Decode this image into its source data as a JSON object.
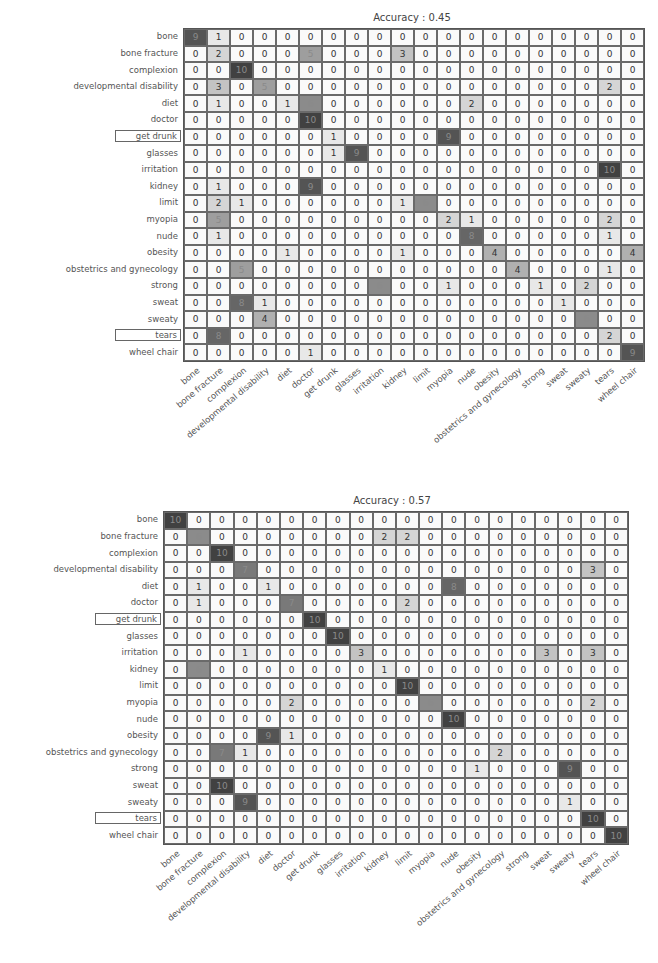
{
  "chart_data": [
    {
      "type": "heatmap",
      "title": "Accuracy : 0.45",
      "xlabel": "",
      "ylabel": "",
      "categories": [
        "bone",
        "bone fracture",
        "complexion",
        "developmental disability",
        "diet",
        "doctor",
        "get drunk",
        "glasses",
        "irritation",
        "kidney",
        "limit",
        "myopia",
        "nude",
        "obesity",
        "obstetrics and gynecology",
        "strong",
        "sweat",
        "sweaty",
        "tears",
        "wheel chair"
      ],
      "highlighted_rows": [
        "get drunk",
        "tears"
      ],
      "matrix": [
        [
          9,
          1,
          0,
          0,
          0,
          0,
          0,
          0,
          0,
          0,
          0,
          0,
          0,
          0,
          0,
          0,
          0,
          0,
          0,
          0
        ],
        [
          0,
          2,
          0,
          0,
          0,
          5,
          0,
          0,
          0,
          3,
          0,
          0,
          0,
          0,
          0,
          0,
          0,
          0,
          0,
          0
        ],
        [
          0,
          0,
          10,
          0,
          0,
          0,
          0,
          0,
          0,
          0,
          0,
          0,
          0,
          0,
          0,
          0,
          0,
          0,
          0,
          0
        ],
        [
          0,
          3,
          0,
          5,
          0,
          0,
          0,
          0,
          0,
          0,
          0,
          0,
          0,
          0,
          0,
          0,
          0,
          0,
          2,
          0
        ],
        [
          0,
          1,
          0,
          0,
          1,
          6,
          0,
          0,
          0,
          0,
          0,
          0,
          2,
          0,
          0,
          0,
          0,
          0,
          0,
          0
        ],
        [
          0,
          0,
          0,
          0,
          0,
          10,
          0,
          0,
          0,
          0,
          0,
          0,
          0,
          0,
          0,
          0,
          0,
          0,
          0,
          0
        ],
        [
          0,
          0,
          0,
          0,
          0,
          0,
          1,
          0,
          0,
          0,
          0,
          9,
          0,
          0,
          0,
          0,
          0,
          0,
          0,
          0
        ],
        [
          0,
          0,
          0,
          0,
          0,
          0,
          1,
          9,
          0,
          0,
          0,
          0,
          0,
          0,
          0,
          0,
          0,
          0,
          0,
          0
        ],
        [
          0,
          0,
          0,
          0,
          0,
          0,
          0,
          0,
          0,
          0,
          0,
          0,
          0,
          0,
          0,
          0,
          0,
          0,
          10,
          0
        ],
        [
          0,
          1,
          0,
          0,
          0,
          9,
          0,
          0,
          0,
          0,
          0,
          0,
          0,
          0,
          0,
          0,
          0,
          0,
          0,
          0
        ],
        [
          0,
          2,
          1,
          0,
          0,
          0,
          0,
          0,
          0,
          1,
          6,
          0,
          0,
          0,
          0,
          0,
          0,
          0,
          0,
          0
        ],
        [
          0,
          5,
          0,
          0,
          0,
          0,
          0,
          0,
          0,
          0,
          0,
          2,
          1,
          0,
          0,
          0,
          0,
          0,
          2,
          0
        ],
        [
          0,
          1,
          0,
          0,
          0,
          0,
          0,
          0,
          0,
          0,
          0,
          0,
          8,
          0,
          0,
          0,
          0,
          0,
          1,
          0
        ],
        [
          0,
          0,
          0,
          0,
          1,
          0,
          0,
          0,
          0,
          1,
          0,
          0,
          0,
          4,
          0,
          0,
          0,
          0,
          0,
          4
        ],
        [
          0,
          0,
          5,
          0,
          0,
          0,
          0,
          0,
          0,
          0,
          0,
          0,
          0,
          0,
          4,
          0,
          0,
          0,
          1,
          0
        ],
        [
          0,
          0,
          0,
          0,
          0,
          0,
          0,
          0,
          6,
          0,
          0,
          1,
          0,
          0,
          0,
          1,
          0,
          2,
          0,
          0
        ],
        [
          0,
          0,
          8,
          1,
          0,
          0,
          0,
          0,
          0,
          0,
          0,
          0,
          0,
          0,
          0,
          0,
          1,
          0,
          0,
          0
        ],
        [
          0,
          0,
          0,
          4,
          0,
          0,
          0,
          0,
          0,
          0,
          0,
          0,
          0,
          0,
          0,
          0,
          0,
          6,
          0,
          0
        ],
        [
          0,
          8,
          0,
          0,
          0,
          0,
          0,
          0,
          0,
          0,
          0,
          0,
          0,
          0,
          0,
          0,
          0,
          0,
          2,
          0
        ],
        [
          0,
          0,
          0,
          0,
          0,
          1,
          0,
          0,
          0,
          0,
          0,
          0,
          0,
          0,
          0,
          0,
          0,
          0,
          0,
          9
        ]
      ],
      "value_range": [
        0,
        10
      ],
      "colormap": "greys"
    },
    {
      "type": "heatmap",
      "title": "Accuracy : 0.57",
      "xlabel": "",
      "ylabel": "",
      "categories": [
        "bone",
        "bone fracture",
        "complexion",
        "developmental disability",
        "diet",
        "doctor",
        "get drunk",
        "glasses",
        "irritation",
        "kidney",
        "limit",
        "myopia",
        "nude",
        "obesity",
        "obstetrics and gynecology",
        "strong",
        "sweat",
        "sweaty",
        "tears",
        "wheel chair"
      ],
      "highlighted_rows": [
        "get drunk",
        "tears"
      ],
      "matrix": [
        [
          10,
          0,
          0,
          0,
          0,
          0,
          0,
          0,
          0,
          0,
          0,
          0,
          0,
          0,
          0,
          0,
          0,
          0,
          0,
          0
        ],
        [
          0,
          6,
          0,
          0,
          0,
          0,
          0,
          0,
          0,
          2,
          2,
          0,
          0,
          0,
          0,
          0,
          0,
          0,
          0,
          0
        ],
        [
          0,
          0,
          10,
          0,
          0,
          0,
          0,
          0,
          0,
          0,
          0,
          0,
          0,
          0,
          0,
          0,
          0,
          0,
          0,
          0
        ],
        [
          0,
          0,
          0,
          7,
          0,
          0,
          0,
          0,
          0,
          0,
          0,
          0,
          0,
          0,
          0,
          0,
          0,
          0,
          3,
          0
        ],
        [
          0,
          1,
          0,
          0,
          1,
          0,
          0,
          0,
          0,
          0,
          0,
          0,
          8,
          0,
          0,
          0,
          0,
          0,
          0,
          0
        ],
        [
          0,
          1,
          0,
          0,
          0,
          7,
          0,
          0,
          0,
          0,
          2,
          0,
          0,
          0,
          0,
          0,
          0,
          0,
          0,
          0
        ],
        [
          0,
          0,
          0,
          0,
          0,
          0,
          10,
          0,
          0,
          0,
          0,
          0,
          0,
          0,
          0,
          0,
          0,
          0,
          0,
          0
        ],
        [
          0,
          0,
          0,
          0,
          0,
          0,
          0,
          10,
          0,
          0,
          0,
          0,
          0,
          0,
          0,
          0,
          0,
          0,
          0,
          0
        ],
        [
          0,
          0,
          0,
          1,
          0,
          0,
          0,
          0,
          3,
          0,
          0,
          0,
          0,
          0,
          0,
          0,
          3,
          0,
          3,
          0
        ],
        [
          0,
          6,
          0,
          0,
          0,
          0,
          0,
          0,
          0,
          1,
          0,
          0,
          0,
          0,
          0,
          0,
          0,
          0,
          0,
          0
        ],
        [
          0,
          0,
          0,
          0,
          0,
          0,
          0,
          0,
          0,
          0,
          10,
          0,
          0,
          0,
          0,
          0,
          0,
          0,
          0,
          0
        ],
        [
          0,
          0,
          0,
          0,
          0,
          2,
          0,
          0,
          0,
          0,
          0,
          6,
          0,
          0,
          0,
          0,
          0,
          0,
          2,
          0
        ],
        [
          0,
          0,
          0,
          0,
          0,
          0,
          0,
          0,
          0,
          0,
          0,
          0,
          10,
          0,
          0,
          0,
          0,
          0,
          0,
          0
        ],
        [
          0,
          0,
          0,
          0,
          9,
          1,
          0,
          0,
          0,
          0,
          0,
          0,
          0,
          0,
          0,
          0,
          0,
          0,
          0,
          0
        ],
        [
          0,
          0,
          7,
          1,
          0,
          0,
          0,
          0,
          0,
          0,
          0,
          0,
          0,
          0,
          2,
          0,
          0,
          0,
          0,
          0
        ],
        [
          0,
          0,
          0,
          0,
          0,
          0,
          0,
          0,
          0,
          0,
          0,
          0,
          0,
          1,
          0,
          0,
          0,
          9,
          0,
          0
        ],
        [
          0,
          0,
          10,
          0,
          0,
          0,
          0,
          0,
          0,
          0,
          0,
          0,
          0,
          0,
          0,
          0,
          0,
          0,
          0,
          0
        ],
        [
          0,
          0,
          0,
          9,
          0,
          0,
          0,
          0,
          0,
          0,
          0,
          0,
          0,
          0,
          0,
          0,
          0,
          1,
          0,
          0
        ],
        [
          0,
          0,
          0,
          0,
          0,
          0,
          0,
          0,
          0,
          0,
          0,
          0,
          0,
          0,
          0,
          0,
          0,
          0,
          10,
          0
        ],
        [
          0,
          0,
          0,
          0,
          0,
          0,
          0,
          0,
          0,
          0,
          0,
          0,
          0,
          0,
          0,
          0,
          0,
          0,
          0,
          10
        ]
      ],
      "value_range": [
        0,
        10
      ],
      "colormap": "greys"
    }
  ],
  "layout": {
    "charts": [
      {
        "grid_left": 183,
        "grid_top": 28,
        "cell_w": 23.0,
        "cell_h": 16.6,
        "title_x": 412,
        "title_y": 12,
        "label_right": 178
      },
      {
        "grid_left": 163,
        "grid_top": 511,
        "cell_w": 23.2,
        "cell_h": 16.6,
        "title_x": 392,
        "title_y": 495,
        "label_right": 158
      }
    ]
  }
}
